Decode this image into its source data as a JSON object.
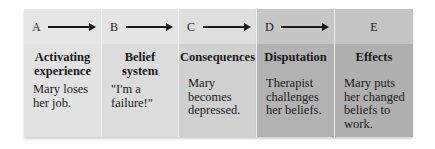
{
  "diagram": {
    "type": "ABCDE model flow",
    "panels": [
      {
        "letter": "A",
        "title_l1": "Activating",
        "title_l2": "experience",
        "desc_l1": "Mary loses",
        "desc_l2": "her job.",
        "desc_l3": "",
        "desc_l4": "",
        "has_arrow": true,
        "top_color": "#e6e6e6",
        "body_color": "#e2e2e2"
      },
      {
        "letter": "B",
        "title_l1": "Belief",
        "title_l2": "system",
        "desc_l1": "\"I'm a",
        "desc_l2": "failure!\"",
        "desc_l3": "",
        "desc_l4": "",
        "has_arrow": true,
        "top_color": "#e4e4e4",
        "body_color": "#dcdcdc"
      },
      {
        "letter": "C",
        "title_l1": "Consequences",
        "title_l2": "",
        "desc_l1": "Mary",
        "desc_l2": "becomes",
        "desc_l3": "depressed.",
        "desc_l4": "",
        "has_arrow": true,
        "top_color": "#dedede",
        "body_color": "#d0d0d0"
      },
      {
        "letter": "D",
        "title_l1": "Disputation",
        "title_l2": "",
        "desc_l1": "Therapist",
        "desc_l2": "challenges",
        "desc_l3": "her beliefs.",
        "desc_l4": "",
        "has_arrow": true,
        "top_color": "#c6c6c6",
        "body_color": "#b2b2b2"
      },
      {
        "letter": "E",
        "title_l1": "Effects",
        "title_l2": "",
        "desc_l1": "Mary puts",
        "desc_l2": "her changed",
        "desc_l3": "beliefs to",
        "desc_l4": "work.",
        "has_arrow": false,
        "top_color": "#c4c4c4",
        "body_color": "#afafaf"
      }
    ]
  }
}
